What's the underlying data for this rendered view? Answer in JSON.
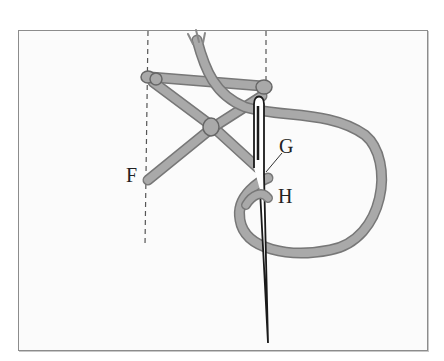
{
  "diagram": {
    "type": "embroidery-stitch-instruction",
    "labels": {
      "F": "F",
      "G": "G",
      "H": "H"
    },
    "elements": {
      "guide_lines": [
        "left-dashed-guide",
        "right-dashed-guide"
      ],
      "thread": "thread",
      "needle": "needle"
    },
    "colors": {
      "background": "#ffffff",
      "frame_fill": "#fbfbfb",
      "frame_border": "#8c8c8c",
      "thread_fill": "#a9a9a9",
      "thread_outline": "#777777",
      "needle_outline": "#1a1a1a",
      "guide_line": "#555555",
      "label": "#222222"
    }
  }
}
